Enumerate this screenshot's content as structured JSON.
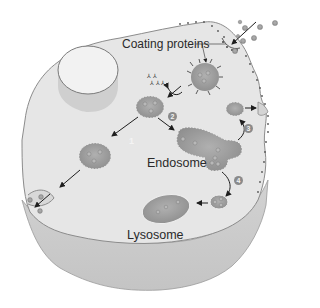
{
  "diagram": {
    "labels": {
      "coating_proteins": "Coating proteins",
      "endosome": "Endosome",
      "lysosome": "Lysosome"
    },
    "steps": [
      {
        "number": "1",
        "description": "Coated vesicle transported to plasma membrane (exocytosis of contents)"
      },
      {
        "number": "2",
        "description": "Vesicle loses coat and fuses with endosome"
      },
      {
        "number": "3",
        "description": "Receptor vesicle recycled back to plasma membrane"
      },
      {
        "number": "4",
        "description": "Vesicle buds from endosome and fuses with lysosome"
      }
    ],
    "structures": [
      "cell",
      "nucleus",
      "coated pit",
      "coated vesicle",
      "uncoated vesicle",
      "endosome",
      "transport vesicle",
      "lysosome",
      "extracellular particles"
    ],
    "colors": {
      "cell_fill": "#e4e4e4",
      "cell_outline": "#8c8c8c",
      "vesicle_fill": "#9a9a9a",
      "particle": "#a8a8a8",
      "arrow": "#1e1e1e",
      "text": "#2a2a2a"
    }
  }
}
